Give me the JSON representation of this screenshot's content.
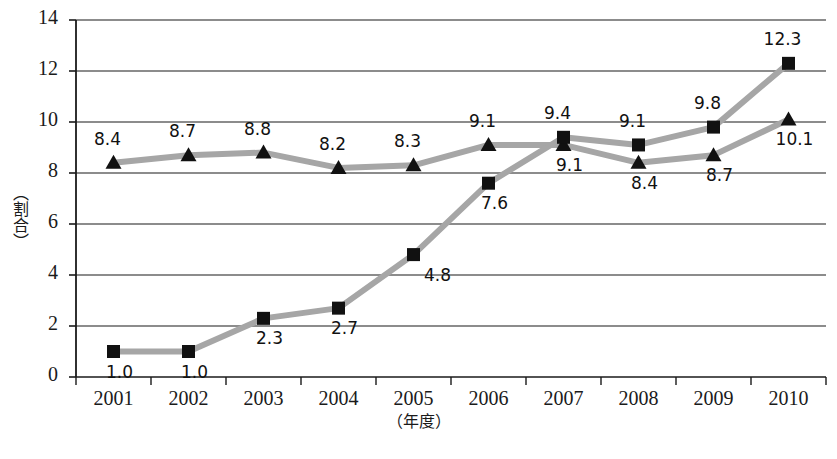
{
  "chart_data": {
    "type": "line",
    "title": "",
    "subtitle": "",
    "xlabel": "（年度）",
    "ylabel": "（割合）",
    "categories": [
      "2001",
      "2002",
      "2003",
      "2004",
      "2005",
      "2006",
      "2007",
      "2008",
      "2009",
      "2010"
    ],
    "ylim": [
      0,
      14
    ],
    "ytick_labels": [
      "0",
      "2",
      "4",
      "6",
      "8",
      "10",
      "12",
      "14"
    ],
    "ytick_values": [
      0,
      2,
      4,
      6,
      8,
      10,
      12,
      14
    ],
    "grid": "horizontal",
    "legend": "none",
    "series": [
      {
        "name": "triangle-series",
        "marker": "triangle",
        "values": [
          8.4,
          8.7,
          8.8,
          8.2,
          8.3,
          9.1,
          9.1,
          8.4,
          8.7,
          10.1
        ],
        "labels": [
          "8.4",
          "8.7",
          "8.8",
          "8.2",
          "8.3",
          "9.1",
          "9.1",
          "8.4",
          "8.7",
          "10.1"
        ],
        "label_positions": [
          "above",
          "above",
          "above",
          "above",
          "above",
          "above",
          "below",
          "below",
          "below",
          "below"
        ]
      },
      {
        "name": "square-series",
        "marker": "square",
        "values": [
          1.0,
          1.0,
          2.3,
          2.7,
          4.8,
          7.6,
          9.4,
          9.1,
          9.8,
          12.3
        ],
        "labels": [
          "1.0",
          "1.0",
          "2.3",
          "2.7",
          "4.8",
          "7.6",
          "9.4",
          "9.1",
          "9.8",
          "12.3"
        ],
        "label_positions": [
          "below",
          "below",
          "below",
          "below",
          "below-right",
          "below",
          "above",
          "above",
          "above",
          "above"
        ]
      }
    ],
    "colors": {
      "line": "#a6a6a6",
      "marker": "#111111",
      "axis": "#1a1a1a",
      "grid": "#1a1a1a",
      "background": "#ffffff",
      "text": "#1a1a1a"
    }
  }
}
